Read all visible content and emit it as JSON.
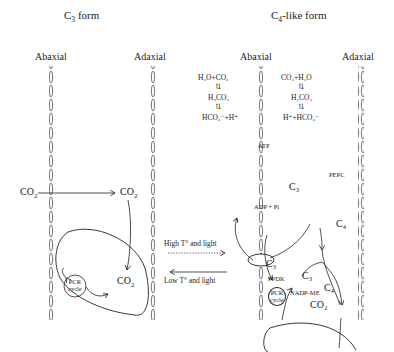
{
  "panels": {
    "c3": {
      "title_main": "C",
      "title_sub": "3",
      "title_rest": " form",
      "abaxial": "Abaxial",
      "adaxial": "Adaxial",
      "co2_outside": "CO",
      "co2_outside_sub": "2",
      "co2_inside": "CO",
      "co2_inside_sub": "2",
      "co2_chloroplast": "CO",
      "co2_chloroplast_sub": "2",
      "pcr_line1": "PCR",
      "pcr_line2": "cycle"
    },
    "c4": {
      "title_main": "C",
      "title_sub": "4",
      "title_rest": "-like form",
      "abaxial": "Abaxial",
      "adaxial": "Adaxial",
      "left_eq1": "H₂O+CO₂",
      "left_eq2": "H₂CO₃",
      "left_eq3": "HCO₃⁻+H⁺",
      "right_eq1": "CO₂+H₂O",
      "right_eq2": "H₂CO₃",
      "right_eq3": "H⁺+HCO₃⁻",
      "atp": "ATP",
      "adp": "ADP + Pi",
      "pepc": "PEPC",
      "c3_a": "C₃",
      "c4_a": "C₄",
      "c3_b": "C₃",
      "c3_c": "C₃",
      "c4_b": "C₄",
      "ppdk": "PPDK",
      "nadp_me": "NADP-ME",
      "co2": "CO₂",
      "pcr_line1": "PCR",
      "pcr_line2": "cycle"
    }
  },
  "transition": {
    "forward": "High T° and light",
    "reverse": "Low T° and light"
  }
}
